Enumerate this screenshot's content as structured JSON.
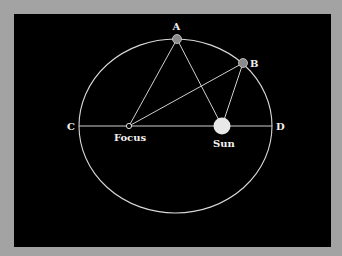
{
  "diagram": {
    "type": "kepler-orbit-ellipse",
    "colors": {
      "background": "#a3a3a3",
      "panel": "#000000",
      "lines": "#d9d9d9",
      "planet": "#8a8a8a",
      "sun": "#e8e8e8",
      "text": "#f2f2f2"
    },
    "ellipse": {
      "cx": 175.5,
      "cy": 126,
      "rx": 96.5,
      "ry": 87
    },
    "points": {
      "A": {
        "label": "A",
        "x": 177,
        "y": 39
      },
      "B": {
        "label": "B",
        "x": 243,
        "y": 63
      },
      "C": {
        "label": "C",
        "x": 79,
        "y": 126
      },
      "D": {
        "label": "D",
        "x": 272,
        "y": 126
      },
      "focus": {
        "label": "Focus",
        "x": 129,
        "y": 126
      },
      "sun": {
        "label": "Sun",
        "x": 222,
        "y": 126
      }
    },
    "labels": {
      "A": "A",
      "B": "B",
      "C": "C",
      "D": "D",
      "focus": "Focus",
      "sun": "Sun"
    }
  }
}
